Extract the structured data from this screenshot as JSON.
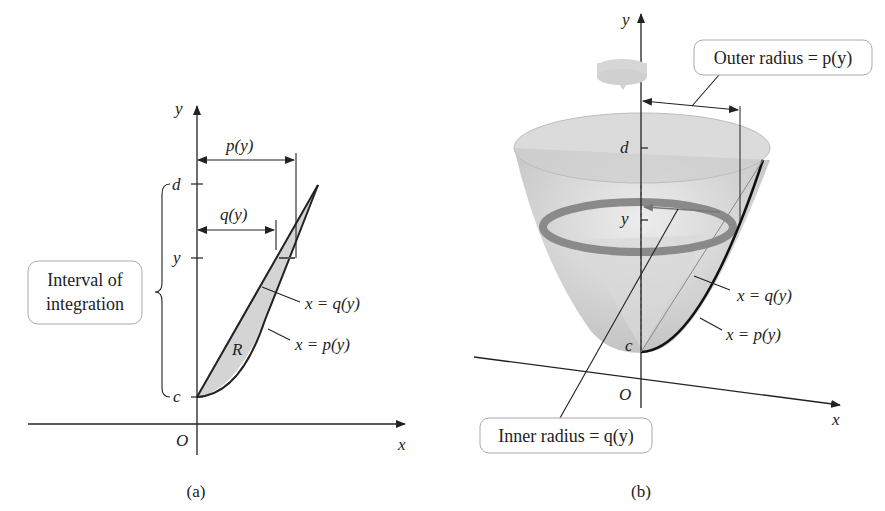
{
  "panel_a": {
    "caption": "(a)",
    "axis_x_label": "x",
    "axis_y_label": "y",
    "origin_label": "O",
    "tick_d": "d",
    "tick_y": "y",
    "tick_c": "c",
    "region_label": "R",
    "p_label": "p(y)",
    "q_label": "q(y)",
    "curve_q_label": "x = q(y)",
    "curve_p_label": "x = p(y)",
    "interval_box_line1": "Interval of",
    "interval_box_line2": "integration"
  },
  "panel_b": {
    "caption": "(b)",
    "axis_x_label": "x",
    "axis_y_label": "y",
    "origin_label": "O",
    "tick_d": "d",
    "tick_y": "y",
    "tick_c": "c",
    "outer_radius_label": "Outer radius = p(y)",
    "inner_radius_label": "Inner radius = q(y)",
    "curve_q_label": "x = q(y)",
    "curve_p_label": "x = p(y)"
  },
  "colors": {
    "ink": "#222222",
    "region_fill": "#d4d4d4",
    "solid_fill": "#c8c8c8",
    "washer": "#8a8a8a",
    "box_border": "#aaaaaa"
  }
}
